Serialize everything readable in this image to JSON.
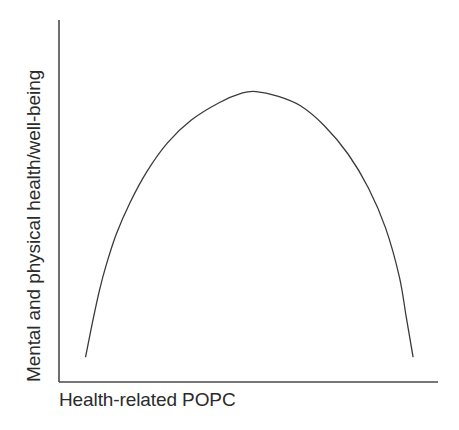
{
  "figure": {
    "background_color": "#ffffff",
    "line_color": "#3a3a3a",
    "axis_color": "#4a4a4a",
    "text_color": "#2b2b2b"
  },
  "axes": {
    "x_label": "Health-related POPC",
    "y_label": "Mental and physical health/well-being"
  },
  "chart_data": {
    "type": "line",
    "title": "",
    "subtitle": "",
    "xlabel": "Health-related POPC",
    "ylabel": "Mental and physical health/well-being",
    "xlim": [
      0,
      1
    ],
    "ylim": [
      0,
      1
    ],
    "grid": false,
    "legend": null,
    "tick_labels": {
      "x": [],
      "y": []
    },
    "annotations": [],
    "series": [
      {
        "name": "Inverted-U relationship",
        "color": "#3a3a3a",
        "x": [
          0.04,
          0.06,
          0.08,
          0.1,
          0.13,
          0.17,
          0.22,
          0.28,
          0.35,
          0.43,
          0.5,
          0.54,
          0.6,
          0.67,
          0.74,
          0.81,
          0.87,
          0.92,
          0.96,
          0.98,
          1.0
        ],
        "y": [
          0.04,
          0.16,
          0.27,
          0.36,
          0.47,
          0.58,
          0.69,
          0.79,
          0.87,
          0.93,
          0.965,
          0.97,
          0.955,
          0.92,
          0.85,
          0.75,
          0.63,
          0.49,
          0.32,
          0.18,
          0.04
        ]
      }
    ]
  }
}
